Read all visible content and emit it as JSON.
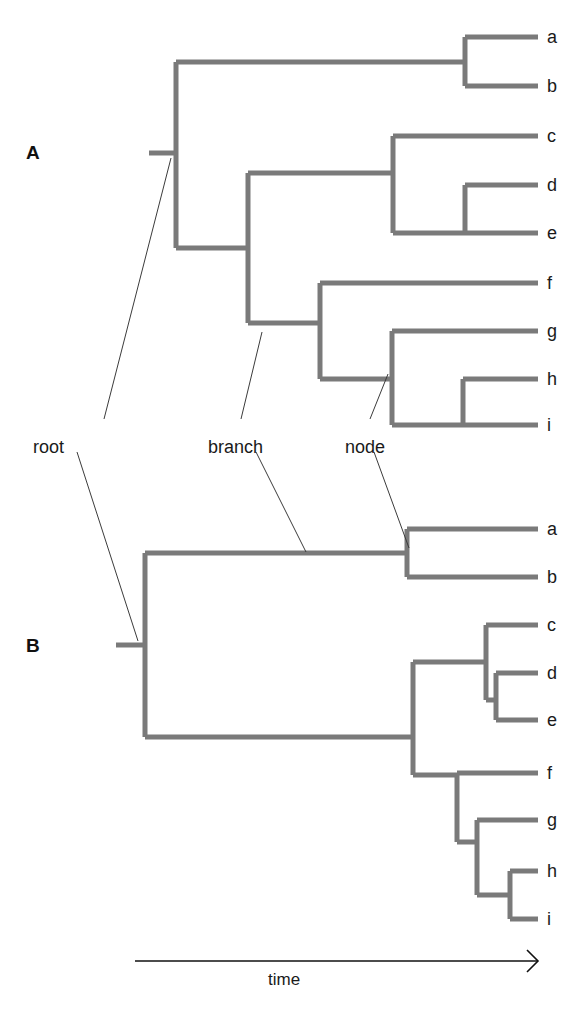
{
  "figure": {
    "width": 567,
    "height": 1012,
    "background": "#ffffff",
    "branch_color": "#7a7a7a",
    "leader_color": "#3b3b3b",
    "text_color": "#1a1a1a",
    "branch_width": 5,
    "leader_width": 1
  },
  "panels": [
    {
      "id": "A",
      "label": "A",
      "x": 26,
      "y": 143
    },
    {
      "id": "B",
      "label": "B",
      "x": 26,
      "y": 636
    }
  ],
  "annotations": [
    {
      "id": "root",
      "label": "root",
      "text_x": 33,
      "text_y": 438,
      "leaders": [
        {
          "x1": 104,
          "y1": 419,
          "x2": 171,
          "y2": 158
        },
        {
          "x1": 77,
          "y1": 452,
          "x2": 138,
          "y2": 641
        }
      ]
    },
    {
      "id": "branch",
      "label": "branch",
      "text_x": 208,
      "text_y": 438,
      "leaders": [
        {
          "x1": 241,
          "y1": 419,
          "x2": 262,
          "y2": 332
        },
        {
          "x1": 256,
          "y1": 452,
          "x2": 306,
          "y2": 552
        }
      ]
    },
    {
      "id": "node",
      "label": "node",
      "text_x": 345,
      "text_y": 438,
      "leaders": [
        {
          "x1": 370,
          "y1": 419,
          "x2": 388,
          "y2": 374
        },
        {
          "x1": 374,
          "y1": 452,
          "x2": 409,
          "y2": 548
        }
      ]
    }
  ],
  "axis": {
    "name": "time-axis",
    "label": "time",
    "label_x": 268,
    "label_y": 971,
    "x1": 135,
    "x2": 538,
    "y": 961,
    "arrow_size": 11
  },
  "caption": {
    "text": "",
    "y": 1000
  },
  "chart_data": {
    "type": "tree",
    "title": "",
    "xlabel": "time",
    "ylabel": "",
    "taxa": [
      "a",
      "b",
      "c",
      "d",
      "e",
      "f",
      "g",
      "h",
      "i"
    ],
    "annotated_parts": [
      "root",
      "branch",
      "node"
    ],
    "panels": [
      {
        "id": "A",
        "root_stub": {
          "x1": 149,
          "x2": 176,
          "y": 153
        },
        "tip_x": 538,
        "tips": [
          {
            "name": "a",
            "y": 37,
            "branch_x": 465
          },
          {
            "name": "b",
            "y": 86,
            "branch_x": 465
          },
          {
            "name": "c",
            "y": 136,
            "branch_x": 393
          },
          {
            "name": "d",
            "y": 185,
            "branch_x": 465
          },
          {
            "name": "e",
            "y": 233,
            "branch_x": 465
          },
          {
            "name": "f",
            "y": 283,
            "branch_x": 320
          },
          {
            "name": "g",
            "y": 331,
            "branch_x": 392
          },
          {
            "name": "h",
            "y": 379,
            "branch_x": 463
          },
          {
            "name": "i",
            "y": 425,
            "branch_x": 463
          }
        ],
        "nodes": [
          {
            "id": "A-root",
            "x": 176,
            "y_top": 62,
            "y_bot": 248,
            "children": [
              "ab",
              "cdefghi"
            ]
          },
          {
            "id": "A-ab",
            "x": 465,
            "y_top": 37,
            "y_bot": 86,
            "parent_y": 62,
            "parent_x": 176
          },
          {
            "id": "A-cdefghi",
            "x": 248,
            "y_top": 173,
            "y_bot": 323,
            "parent_y": 248,
            "parent_x": 176
          },
          {
            "id": "A-cde",
            "x": 393,
            "y_top": 136,
            "y_bot": 233,
            "parent_y": 173,
            "parent_x": 248
          },
          {
            "id": "A-de",
            "x": 465,
            "y_top": 185,
            "y_bot": 233,
            "parent_y": 233,
            "parent_x": 393
          },
          {
            "id": "A-fghi",
            "x": 320,
            "y_top": 283,
            "y_bot": 379,
            "parent_y": 323,
            "parent_x": 248
          },
          {
            "id": "A-ghi",
            "x": 392,
            "y_top": 331,
            "y_bot": 425,
            "parent_y": 379,
            "parent_x": 320
          },
          {
            "id": "A-hi",
            "x": 463,
            "y_top": 379,
            "y_bot": 425,
            "parent_y": 425,
            "parent_x": 392
          }
        ]
      },
      {
        "id": "B",
        "root_stub": {
          "x1": 116,
          "x2": 145,
          "y": 645
        },
        "tip_x": 538,
        "tips": [
          {
            "name": "a",
            "y": 529,
            "branch_x": 407
          },
          {
            "name": "b",
            "y": 577,
            "branch_x": 407
          },
          {
            "name": "c",
            "y": 625,
            "branch_x": 486
          },
          {
            "name": "d",
            "y": 673,
            "branch_x": 496
          },
          {
            "name": "e",
            "y": 720,
            "branch_x": 496
          },
          {
            "name": "f",
            "y": 773,
            "branch_x": 457
          },
          {
            "name": "g",
            "y": 820,
            "branch_x": 477
          },
          {
            "name": "h",
            "y": 871,
            "branch_x": 510
          },
          {
            "name": "i",
            "y": 919,
            "branch_x": 510
          }
        ],
        "nodes": [
          {
            "id": "B-root",
            "x": 145,
            "y_top": 553,
            "y_bot": 737
          },
          {
            "id": "B-ab",
            "x": 407,
            "y_top": 529,
            "y_bot": 577,
            "parent_y": 553,
            "parent_x": 145
          },
          {
            "id": "B-cdefghi",
            "x": 413,
            "y_top": 662,
            "y_bot": 775,
            "parent_y": 737,
            "parent_x": 145
          },
          {
            "id": "B-cde",
            "x": 486,
            "y_top": 625,
            "y_bot": 700,
            "parent_y": 662,
            "parent_x": 413
          },
          {
            "id": "B-de",
            "x": 496,
            "y_top": 673,
            "y_bot": 720,
            "parent_y": 700,
            "parent_x": 486
          },
          {
            "id": "B-fghi",
            "x": 457,
            "y_top": 773,
            "y_bot": 842,
            "parent_y": 775,
            "parent_x": 413
          },
          {
            "id": "B-ghi",
            "x": 477,
            "y_top": 820,
            "y_bot": 895,
            "parent_y": 842,
            "parent_x": 457
          },
          {
            "id": "B-hi",
            "x": 510,
            "y_top": 871,
            "y_bot": 919,
            "parent_y": 895,
            "parent_x": 477
          }
        ]
      }
    ]
  }
}
